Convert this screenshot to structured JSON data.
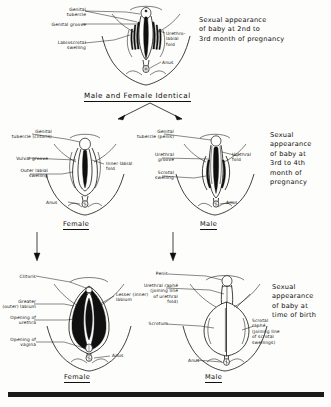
{
  "figure": {
    "bottom_bar": "scan-edge-bar"
  },
  "stages": [
    {
      "id": "stage-1",
      "caption": "Sexual appearance\nof baby at 2nd to\n3rd month of pregnancy",
      "section_title": "Male and Female Identical",
      "panels": [
        {
          "id": "indifferent",
          "labels": [
            "Genital\ntubercle",
            "Genital groove",
            "Labioscrotal\nswelling",
            "Urethro-\nlabial\nfold",
            "Anus"
          ]
        }
      ]
    },
    {
      "id": "stage-2",
      "caption": "Sexual\nappearance\nof baby at\n3rd to 4th\nmonth of\npregnancy",
      "panels": [
        {
          "id": "female-stage-2",
          "title": "Female",
          "labels": [
            "Genital\ntubercle (clitoris)",
            "Vulval groove",
            "Outer labial\nswelling",
            "Inner labial\nfold",
            "Anus"
          ]
        },
        {
          "id": "male-stage-2",
          "title": "Male",
          "labels": [
            "Genital\ntubercle (penis)",
            "Urethral\ngroove",
            "Urethral\nfold",
            "Scrotal\nswelling",
            "Anus"
          ]
        }
      ]
    },
    {
      "id": "stage-3",
      "caption": "Sexual\nappearance\nof baby at\ntime of birth",
      "panels": [
        {
          "id": "female-stage-3",
          "title": "Female",
          "labels": [
            "Clitoris",
            "Greater\n(outer) labium",
            "Opening of\nurethra",
            "Opening of\nvagina",
            "Lesser (inner)\nlabium",
            "Anus"
          ]
        },
        {
          "id": "male-stage-3",
          "title": "Male",
          "labels": [
            "Penis",
            "Urethral raphé\n(joining line\nof urethral\nfold)",
            "Scrotum",
            "Scrotal\nraphé\n(joining line\nof scrotal\nswellings)",
            "Anus"
          ]
        }
      ]
    }
  ],
  "colors": {
    "ink": "#121212",
    "paper": "#fdfdfb"
  }
}
